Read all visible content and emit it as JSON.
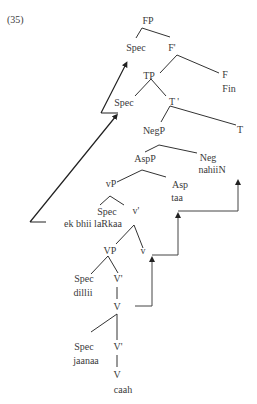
{
  "example_number": "(35)",
  "colors": {
    "ink": "#3a3a3a",
    "background": "#ffffff"
  },
  "nodes": {
    "fp": "FP",
    "fp_spec": "Spec",
    "f_bar": "F'",
    "tp": "TP",
    "f_head": "F",
    "f_word": "Fin",
    "tp_spec": "Spec",
    "t_bar": "T '",
    "negp": "NegP",
    "t_head": "T",
    "aspp": "AspP",
    "neg_head": "Neg",
    "neg_word": "nahiiN",
    "vp_light": "vP",
    "asp_head": "Asp",
    "asp_word": "taa",
    "vp_light_spec": "Spec",
    "v_light_bar": "v'",
    "subject_word": "ek bhii laRkaa",
    "vp_main": "VP",
    "v_light_head": "v",
    "vp_spec": "Spec",
    "vp_spec_word": "dillii",
    "v_bar_1": "V'",
    "v_head_1": "V",
    "inner_spec": "Spec",
    "inner_spec_word": "jaanaa",
    "v_bar_2": "V'",
    "v_head_2": "V",
    "verb_word": "caah"
  }
}
